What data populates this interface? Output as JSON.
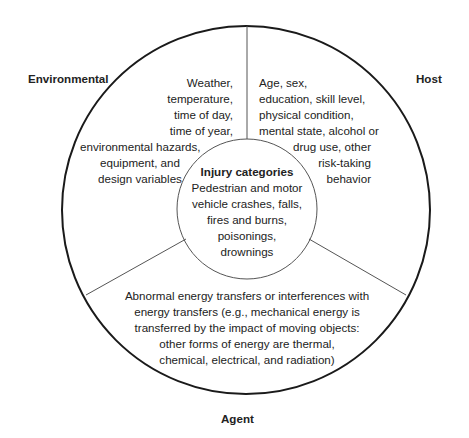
{
  "diagram": {
    "type": "epidemiologic-triangle-circle",
    "colors": {
      "outer_circle": "#1a1a1a",
      "inner_circle": "#555555",
      "dividers": "#555555",
      "text": "#222222",
      "background": "#ffffff"
    },
    "labels": {
      "environmental": "Environmental",
      "host": "Host",
      "agent": "Agent"
    },
    "environmental_text": {
      "right_aligned_lines": [
        "Weather,",
        "temperature,",
        "time of day,",
        "time of year,"
      ],
      "centered_lines": [
        "environmental hazards,",
        "equipment, and",
        "design variables"
      ]
    },
    "host_text": {
      "left_aligned_lines": [
        "Age, sex,",
        "education, skill level,",
        "physical condition,",
        "mental state, alcohol or"
      ],
      "right_aligned_lines": [
        "drug use, other",
        "risk-taking",
        "behavior"
      ]
    },
    "center": {
      "title": "Injury categories",
      "lines": [
        "Pedestrian and motor",
        "vehicle crashes, falls,",
        "fires and burns,",
        "poisonings,",
        "drownings"
      ]
    },
    "agent_text": {
      "lines": [
        "Abnormal energy transfers or interferences with",
        "energy transfers (e.g., mechanical energy is",
        "transferred by the impact of moving objects:",
        "other forms of energy are thermal,",
        "chemical, electrical, and radiation)"
      ]
    }
  }
}
